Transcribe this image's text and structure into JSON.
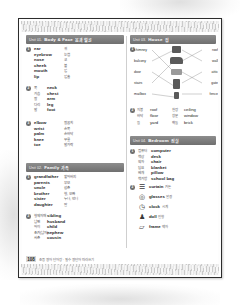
{
  "page": {
    "number": "108",
    "footer_note": "초등 영어 단어장 · 필수 영단어 따라쓰기"
  },
  "units": [
    {
      "id": "unit-01",
      "number": "Unit 01.",
      "title": "Body & Face",
      "title_kr": "몸과 얼굴",
      "groups": [
        {
          "badge": "1",
          "layout": "en-first",
          "items": [
            {
              "en": "ear",
              "kr": "귀"
            },
            {
              "en": "eyebrow",
              "kr": "눈썹"
            },
            {
              "en": "nose",
              "kr": "코"
            },
            {
              "en": "cheek",
              "kr": "볼"
            },
            {
              "en": "mouth",
              "kr": "입"
            },
            {
              "en": "lip",
              "kr": "입술"
            }
          ]
        },
        {
          "badge": "2",
          "layout": "kr-first",
          "items": [
            {
              "kr": "목",
              "en": "neck"
            },
            {
              "kr": "가슴",
              "en": "chest"
            },
            {
              "kr": "팔",
              "en": "arm"
            },
            {
              "kr": "다리",
              "en": "leg"
            },
            {
              "kr": "발",
              "en": "foot"
            }
          ]
        },
        {
          "badge": "3",
          "layout": "en-first",
          "items": [
            {
              "en": "elbow",
              "kr": "팔꿈치"
            },
            {
              "en": "wrist",
              "kr": "손목"
            },
            {
              "en": "palm",
              "kr": "손바닥"
            },
            {
              "en": "knee",
              "kr": "무릎"
            },
            {
              "en": "toe",
              "kr": "발가락"
            }
          ]
        }
      ]
    },
    {
      "id": "unit-02",
      "number": "Unit 02.",
      "title": "Family",
      "title_kr": "가족",
      "groups": [
        {
          "badge": "1",
          "layout": "en-first",
          "items": [
            {
              "en": "grandfather",
              "kr": "할아버지"
            },
            {
              "en": "parents",
              "kr": "부모"
            },
            {
              "en": "uncle",
              "kr": "삼촌"
            },
            {
              "en": "brother",
              "kr": "형, 오빠"
            },
            {
              "en": "sister",
              "kr": "누나, 언니"
            },
            {
              "en": "daughter",
              "kr": "딸"
            }
          ]
        },
        {
          "badge": "2",
          "layout": "kr-first",
          "items": [
            {
              "kr": "형제자매",
              "en": "sibling"
            },
            {
              "kr": "남편",
              "en": "husband"
            },
            {
              "kr": "아이",
              "en": "child"
            },
            {
              "kr": "조카(남자)",
              "en": "nephew"
            },
            {
              "kr": "사촌",
              "en": "cousin"
            }
          ]
        }
      ]
    },
    {
      "id": "unit-03",
      "number": "Unit 03.",
      "title": "House",
      "title_kr": "집",
      "matching": {
        "badge": "1",
        "left_labels": [
          "chimney",
          "balcony",
          "door",
          "stairs",
          "mailbox"
        ],
        "right_labels": [
          "roof",
          "wall",
          "attic",
          "gate",
          "fence"
        ],
        "pictures": [
          "chimney-icon",
          "roof-icon",
          "attic-icon",
          "door-icon",
          "mailbox-icon"
        ]
      },
      "mini_list": {
        "badge": "2",
        "rows": [
          {
            "kr_left": "지붕",
            "en_left": "roof",
            "kr_right": "천장",
            "en_right": "ceiling"
          },
          {
            "kr_left": "바닥",
            "en_left": "floor",
            "kr_right": "창문",
            "en_right": "window"
          },
          {
            "kr_left": "뜰",
            "en_left": "yard",
            "kr_right": "벽돌",
            "en_right": "brick"
          }
        ]
      }
    },
    {
      "id": "unit-04",
      "number": "Unit 04.",
      "title": "Bedroom",
      "title_kr": "침실",
      "groups": [
        {
          "badge": "1",
          "layout": "kr-first",
          "items": [
            {
              "kr": "컴퓨터",
              "en": "computer"
            },
            {
              "kr": "책상",
              "en": "desk"
            },
            {
              "kr": "의자",
              "en": "chair"
            },
            {
              "kr": "담요",
              "en": "blanket"
            },
            {
              "kr": "베개",
              "en": "pillow"
            },
            {
              "kr": "책가방",
              "en": "school bag"
            }
          ]
        }
      ],
      "icon_list": {
        "badge": "2",
        "items": [
          {
            "icon": "curtain-icon",
            "glyph": "☰",
            "en": "curtain",
            "kr": "커튼"
          },
          {
            "icon": "glasses-icon",
            "glyph": "◎",
            "en": "glasses",
            "kr": "안경"
          },
          {
            "icon": "clock-icon",
            "glyph": "◷",
            "en": "clock",
            "kr": "시계"
          },
          {
            "icon": "doll-icon",
            "glyph": "♟",
            "en": "doll",
            "kr": "인형"
          },
          {
            "icon": "frame-icon",
            "glyph": "▱",
            "en": "frame",
            "kr": "액자"
          }
        ]
      }
    }
  ],
  "colors": {
    "bar_dark": "#6f6f6f",
    "bar_light": "#8d8d8d",
    "page_border": "#2c2c2c",
    "text": "#1d1d1d",
    "text_kr": "#555555"
  }
}
